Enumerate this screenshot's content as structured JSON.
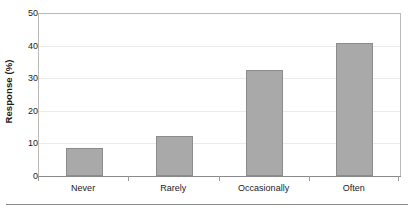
{
  "chart_data": {
    "type": "bar",
    "title": "",
    "subtitle": "",
    "xlabel": "",
    "ylabel": "Response (%)",
    "categories": [
      "Never",
      "Rarely",
      "Occasionally",
      "Often"
    ],
    "values": [
      8.7,
      12.4,
      32.4,
      40.8
    ],
    "ylim": [
      0,
      50
    ],
    "ytick_values": [
      0,
      10,
      20,
      30,
      40,
      50
    ],
    "ytick_labels": [
      "0",
      "10",
      "20",
      "30",
      "40",
      "50"
    ],
    "grid": true,
    "grid_axis": "y",
    "legend": false,
    "legend_position": "none",
    "bar_color": "#a9a9a9",
    "bar_edge_color": "#8c8c8c",
    "gridline_color": "#ebebeb",
    "axis_color": "#8a8a8a",
    "text_color": "#1a1a1a",
    "background_color": "#ffffff"
  }
}
